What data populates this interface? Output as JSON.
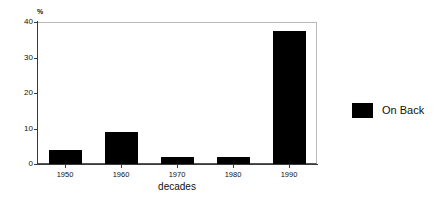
{
  "chart_data": {
    "type": "bar",
    "title": "",
    "categories": [
      "1950",
      "1960",
      "1970",
      "1980",
      "1990"
    ],
    "values": [
      4,
      9,
      2,
      2,
      37.5
    ],
    "series": [
      {
        "name": "On Back",
        "values": [
          4,
          9,
          2,
          2,
          37.5
        ],
        "color": "#000000"
      }
    ],
    "xlabel": "decades",
    "ylabel": "%",
    "ylim": [
      0,
      40
    ],
    "yticks": [
      0,
      10,
      20,
      30,
      40
    ],
    "ytick_labels": [
      "0",
      "10",
      "20",
      "30",
      "40"
    ],
    "grid": false,
    "legend_position": "right",
    "legend_entries": [
      {
        "label": "On Back",
        "color": "#000000"
      }
    ]
  },
  "axes": {
    "y_unit_label": "%",
    "x_axis_title": "decades"
  },
  "legend": {
    "entry_label": "On Back",
    "swatch_color": "#000000"
  },
  "colors": {
    "bar": "#000000",
    "axis": "#3a3a3a",
    "frame": "#b9b9b9",
    "text": "#111111",
    "background": "#ffffff"
  }
}
